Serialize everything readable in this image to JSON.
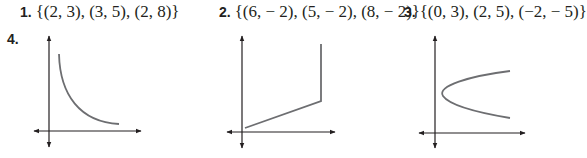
{
  "problems": [
    {
      "number": "1.",
      "text": "{(2, 3), (3, 5), (2, 8)}"
    },
    {
      "number": "2.",
      "text": "{(6, − 2), (5, − 2), (8, − 2)}"
    },
    {
      "number": "3.",
      "text": "{(0, 3), (2, 5), (−2, − 5)}"
    },
    {
      "number": "4."
    }
  ],
  "graphs": [
    {
      "name": "decreasing-curve",
      "description": "decaying curve in first quadrant"
    },
    {
      "name": "line-then-vertical",
      "description": "increasing line segment followed by vertical segment"
    },
    {
      "name": "sideways-parabola",
      "description": "parabola opening to the right"
    }
  ],
  "colors": {
    "axis": "#231f20",
    "curve": "#6d6e71",
    "text": "#231f20"
  }
}
